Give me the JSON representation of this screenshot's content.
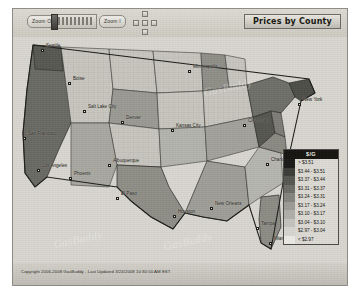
{
  "window": {
    "title": "Prices by County"
  },
  "toolbar": {
    "zoom_out_label": "Zoom O",
    "zoom_in_label": "Zoom I",
    "slider_name": "zoom-slider",
    "pan_north": "N",
    "pan_south": "S",
    "pan_east": "E",
    "pan_west": "W",
    "pan_center": "C"
  },
  "legend": {
    "header": "$/G",
    "rows": [
      {
        "label": "> $3.51",
        "color": "#1a1a18"
      },
      {
        "label": "$3.44 - $3.51",
        "color": "#3b3b38"
      },
      {
        "label": "$3.37 - $3.44",
        "color": "#565652"
      },
      {
        "label": "$3.31 - $3.37",
        "color": "#6d6d68"
      },
      {
        "label": "$3.24 - $3.31",
        "color": "#85857f"
      },
      {
        "label": "$3.17 - $3.24",
        "color": "#9c9c95"
      },
      {
        "label": "$3.10 - $3.17",
        "color": "#b0b0a9"
      },
      {
        "label": "$3.04 - $3.10",
        "color": "#c4c4bd"
      },
      {
        "label": "$2.97 - $3.04",
        "color": "#d6d6d0"
      },
      {
        "label": "< $2.97",
        "color": "#eceae4"
      }
    ]
  },
  "map": {
    "cities": [
      {
        "name": "Seattle",
        "x": 28,
        "y": 12
      },
      {
        "name": "San Francisco",
        "x": 10,
        "y": 100
      },
      {
        "name": "Los Angeles",
        "x": 24,
        "y": 132
      },
      {
        "name": "Phoenix",
        "x": 56,
        "y": 140
      },
      {
        "name": "Albuquerque",
        "x": 95,
        "y": 127
      },
      {
        "name": "El Paso",
        "x": 103,
        "y": 160
      },
      {
        "name": "Boise",
        "x": 55,
        "y": 45
      },
      {
        "name": "Salt Lake City",
        "x": 70,
        "y": 73
      },
      {
        "name": "Denver",
        "x": 108,
        "y": 84
      },
      {
        "name": "Minneapolis",
        "x": 175,
        "y": 33
      },
      {
        "name": "Kansas City",
        "x": 158,
        "y": 92
      },
      {
        "name": "Houston",
        "x": 160,
        "y": 178
      },
      {
        "name": "New Orleans",
        "x": 197,
        "y": 170
      },
      {
        "name": "Tampa",
        "x": 243,
        "y": 190
      },
      {
        "name": "Miami",
        "x": 256,
        "y": 205
      },
      {
        "name": "Cincinnati",
        "x": 230,
        "y": 87
      },
      {
        "name": "Charlotte",
        "x": 253,
        "y": 126
      },
      {
        "name": "New York",
        "x": 285,
        "y": 66
      }
    ],
    "watermarks": [
      "GasBuddy",
      "GasBuddy",
      "GasBuddy"
    ]
  },
  "footer": {
    "copyright": "Copyright 2006-2008 GasBuddy - Last Updated 3/24/2008 10:30:50 AM EST"
  }
}
